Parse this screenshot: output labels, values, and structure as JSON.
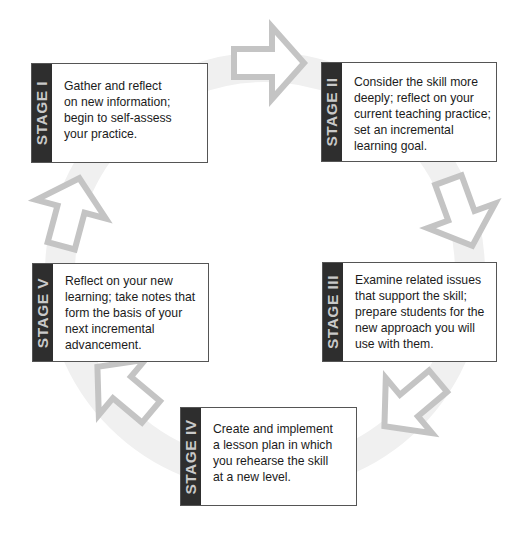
{
  "diagram": {
    "type": "cycle",
    "colors": {
      "ring": "#f0f0f0",
      "arrow_outline": "#c4c4c4",
      "tab_bg": "#2e2e2e",
      "tab_text": "#c9c9c9",
      "box_border": "#555555",
      "text": "#1b1b1b"
    },
    "stages": [
      {
        "label": "STAGE I",
        "lines": [
          "Gather and reflect",
          "on new information;",
          "begin to self-assess",
          "your practice."
        ]
      },
      {
        "label": "STAGE II",
        "lines": [
          "Consider the skill more",
          "deeply; reflect on your",
          "current teaching practice;",
          "set an incremental",
          "learning goal."
        ]
      },
      {
        "label": "STAGE III",
        "lines": [
          "Examine related issues",
          "that support the skill;",
          "prepare students for the",
          "new approach you will",
          "use with them."
        ]
      },
      {
        "label": "STAGE IV",
        "lines": [
          "Create and implement",
          "a lesson plan in which",
          "you rehearse the skill",
          "at a new level."
        ]
      },
      {
        "label": "STAGE V",
        "lines": [
          "Reflect on your new",
          "learning; take notes that",
          "form the basis of your",
          "next incremental",
          "advancement."
        ]
      }
    ],
    "arrows": [
      {
        "from": "STAGE I",
        "to": "STAGE II",
        "direction": "right"
      },
      {
        "from": "STAGE II",
        "to": "STAGE III",
        "direction": "down-right"
      },
      {
        "from": "STAGE III",
        "to": "STAGE IV",
        "direction": "down-left"
      },
      {
        "from": "STAGE IV",
        "to": "STAGE V",
        "direction": "up-left"
      },
      {
        "from": "STAGE V",
        "to": "STAGE I",
        "direction": "up"
      }
    ]
  }
}
